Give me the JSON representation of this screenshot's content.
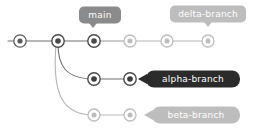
{
  "diagram": {
    "background": "#ffffff",
    "colors": {
      "edge_dark": "#6e6e6e",
      "edge_light": "#b5b5b5",
      "node_dark_ring": "#3b3b3b",
      "node_dark_fill": "#ffffff",
      "node_dark_core": "#3b3b3b",
      "node_light_ring": "#bdbdbd",
      "node_light_fill": "#ffffff",
      "node_light_core": "#bdbdbd",
      "badge_gray": "#8a8a8a",
      "badge_light_gray": "#bdbdbd",
      "badge_dark": "#2b2b2b",
      "badge_text_light": "#ffffff"
    }
  },
  "branches": [
    {
      "id": "main",
      "label": "main",
      "label_style": "gray",
      "label_pointer": "down",
      "y": 41,
      "commits": [
        {
          "id": "c0",
          "x": 20,
          "y": 41,
          "state": "active"
        },
        {
          "id": "c1",
          "x": 58,
          "y": 41,
          "state": "active"
        },
        {
          "id": "c2",
          "x": 94,
          "y": 41,
          "state": "active"
        },
        {
          "id": "c3",
          "x": 130,
          "y": 41,
          "state": "inactive"
        },
        {
          "id": "c4",
          "x": 167,
          "y": 41,
          "state": "inactive"
        },
        {
          "id": "c5",
          "x": 208,
          "y": 41,
          "state": "inactive"
        }
      ]
    },
    {
      "id": "alpha-branch",
      "label": "alpha-branch",
      "label_style": "dark",
      "label_pointer": "left",
      "y": 79,
      "commits": [
        {
          "id": "a1",
          "x": 94,
          "y": 79,
          "state": "active"
        },
        {
          "id": "a2",
          "x": 130,
          "y": 79,
          "state": "active"
        }
      ]
    },
    {
      "id": "beta-branch",
      "label": "beta-branch",
      "label_style": "light",
      "label_pointer": "left",
      "y": 115,
      "commits": [
        {
          "id": "b1",
          "x": 94,
          "y": 115,
          "state": "inactive"
        },
        {
          "id": "b2",
          "x": 130,
          "y": 115,
          "state": "inactive"
        }
      ]
    }
  ],
  "labels": {
    "main": {
      "text": "main",
      "cx": 100,
      "cy": 15,
      "w": 42,
      "h": 17,
      "style": "gray",
      "pointer": "down",
      "tip_x": 94
    },
    "delta": {
      "text": "delta-branch",
      "cx": 208,
      "cy": 14,
      "w": 76,
      "h": 17,
      "style": "light",
      "pointer": "down",
      "tip_x": 208
    },
    "alpha": {
      "text": "alpha-branch",
      "cx": 193,
      "cy": 79,
      "w": 76,
      "h": 17,
      "style": "dark",
      "pointer": "left",
      "tip_y": 79
    },
    "beta": {
      "text": "beta-branch",
      "cx": 190,
      "cy": 115,
      "w": 72,
      "h": 17,
      "style": "light",
      "pointer": "left",
      "tip_y": 115
    }
  },
  "tooltips": {
    "main_branch_tip": "main",
    "delta_branch_tip": "delta-branch",
    "alpha_branch_tip": "alpha-branch",
    "beta_branch_tip": "beta-branch"
  }
}
